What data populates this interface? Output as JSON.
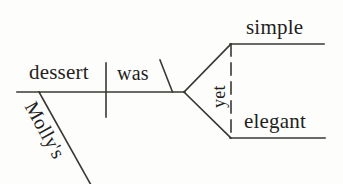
{
  "diagram": {
    "type": "reed-kellogg-sentence-diagram",
    "sentence": "Molly's dessert was simple yet elegant.",
    "stroke_color": "#3a3733",
    "background_color": "#fdfdfc",
    "nodes": {
      "subject": "dessert",
      "verb": "was",
      "subject_modifier": "Molly's",
      "complement_first": "simple",
      "complement_second": "elegant",
      "conjunction": "yet"
    },
    "lines": {
      "baseline": "horizontal main line from x=17 to x=185 at y=92",
      "subject_verb_divider": "vertical line at x=106 from y=63 to y=117",
      "complement_slash": "slanted line from (160,60) to (172,92)",
      "modifier_slant": "slanted line from (39,92) to (91,184)",
      "fork_upper": "line from apex (185,92) to (231,44)",
      "fork_lower": "line from apex (185,92) to (231,138)",
      "complement_line_upper": "horizontal line from x=231 to x=324 at y=44",
      "complement_line_lower": "horizontal line from x=231 to x=325 at y=138",
      "conjunction_dashed": "dashed vertical line at x=231 from y=44 to y=138"
    }
  }
}
